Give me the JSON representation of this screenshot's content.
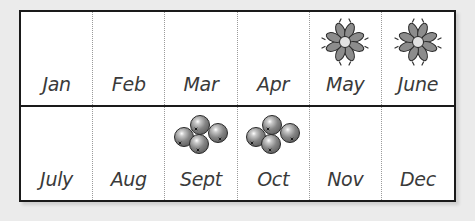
{
  "calendar": {
    "rows": [
      {
        "months": [
          {
            "label": "Jan",
            "icon": null
          },
          {
            "label": "Feb",
            "icon": null
          },
          {
            "label": "Mar",
            "icon": null
          },
          {
            "label": "Apr",
            "icon": null
          },
          {
            "label": "May",
            "icon": "flower-icon"
          },
          {
            "label": "June",
            "icon": "flower-icon"
          }
        ]
      },
      {
        "months": [
          {
            "label": "July",
            "icon": null
          },
          {
            "label": "Aug",
            "icon": null
          },
          {
            "label": "Sept",
            "icon": "berries-icon"
          },
          {
            "label": "Oct",
            "icon": "berries-icon"
          },
          {
            "label": "Nov",
            "icon": null
          },
          {
            "label": "Dec",
            "icon": null
          }
        ]
      }
    ]
  },
  "colors": {
    "border": "#1a1a1a",
    "petal": "#8c8c8c",
    "flower_center": "#e0e0e0",
    "berry": "#7d7d7d",
    "background": "#ebebeb"
  }
}
